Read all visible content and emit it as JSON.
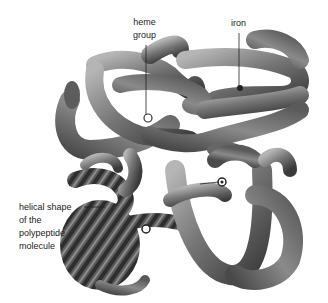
{
  "figure": {
    "style": "grayscale 3D tube illustration",
    "background": "#ffffff",
    "tube_color": "#6e6e6e",
    "tube_highlight": "#b5b5b5",
    "tube_shadow": "#3a3a3a",
    "line_color": "#222222"
  },
  "labels": {
    "heme_group": "heme\ngroup",
    "iron": "iron",
    "helical_shape": "helical shape\nof the\npolypeptide\nmolecule"
  }
}
